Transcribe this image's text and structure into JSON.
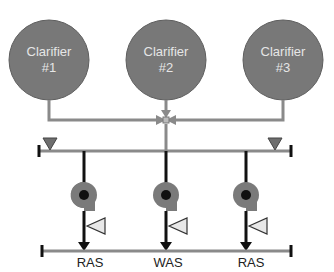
{
  "diagram": {
    "clarifiers": [
      {
        "line1": "Clarifier",
        "line2": "#1"
      },
      {
        "line1": "Clarifier",
        "line2": "#2"
      },
      {
        "line1": "Clarifier",
        "line2": "#3"
      }
    ],
    "outlets": [
      {
        "label": "RAS"
      },
      {
        "label": "WAS"
      },
      {
        "label": "RAS"
      }
    ],
    "colors": {
      "clarifier_fill": "#787878",
      "clarifier_stroke": "#5e5e5e",
      "pipe_gray": "#8a8a8a",
      "pipe_black": "#111111",
      "valve_fill": "#e8e8e8"
    }
  }
}
